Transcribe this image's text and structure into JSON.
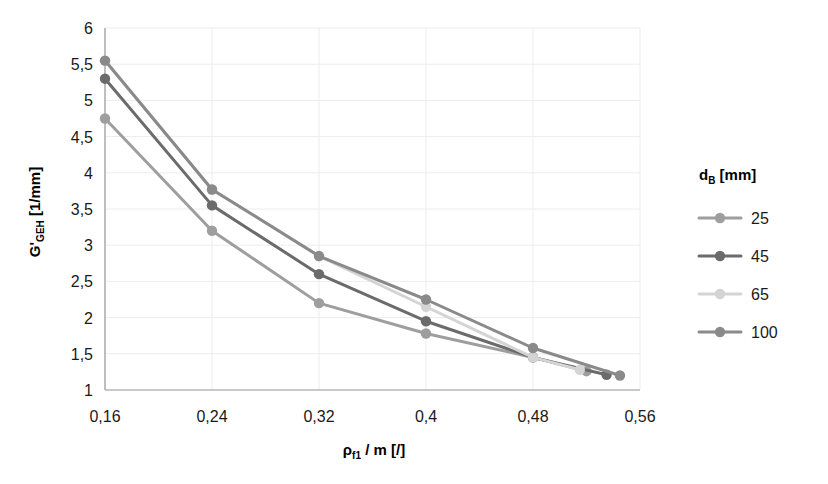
{
  "chart_data": {
    "type": "line",
    "title": "",
    "xlabel": "ρf1 / m [/]",
    "xlabel_base": "ρ",
    "xlabel_sub": "f1",
    "xlabel_rest": " / m [/]",
    "ylabel": "G'GEH [1/mm]",
    "ylabel_base": "G'",
    "ylabel_sub": "GEH",
    "ylabel_rest": " [1/mm]",
    "xlim": [
      0.16,
      0.56
    ],
    "ylim": [
      1,
      6
    ],
    "xticks": [
      0.16,
      0.24,
      0.32,
      0.4,
      0.48,
      0.56
    ],
    "xtick_labels": [
      "0,16",
      "0,24",
      "0,32",
      "0,4",
      "0,48",
      "0,56"
    ],
    "yticks": [
      1,
      1.5,
      2,
      2.5,
      3,
      3.5,
      4,
      4.5,
      5,
      5.5,
      6
    ],
    "ytick_labels": [
      "1",
      "1,5",
      "2",
      "2,5",
      "3",
      "3,5",
      "4",
      "4,5",
      "5",
      "5,5",
      "6"
    ],
    "grid": true,
    "legend_position": "right",
    "legend_title": "dB [mm]",
    "legend_title_base": "d",
    "legend_title_sub": "B",
    "legend_title_rest": " [mm]",
    "marker": "circle",
    "series": [
      {
        "name": "25",
        "color": "#9e9e9e",
        "x": [
          0.16,
          0.24,
          0.32,
          0.4,
          0.48,
          0.52
        ],
        "y": [
          4.75,
          3.2,
          2.2,
          1.78,
          1.45,
          1.26
        ]
      },
      {
        "name": "45",
        "color": "#6b6b6b",
        "x": [
          0.16,
          0.24,
          0.32,
          0.4,
          0.48,
          0.535
        ],
        "y": [
          5.3,
          3.55,
          2.6,
          1.95,
          1.45,
          1.21
        ]
      },
      {
        "name": "65",
        "color": "#d4d4d4",
        "x": [
          0.16,
          0.24,
          0.32,
          0.4,
          0.48,
          0.515
        ],
        "y": [
          5.55,
          3.77,
          2.85,
          2.15,
          1.45,
          1.28
        ]
      },
      {
        "name": "100",
        "color": "#8a8a8a",
        "x": [
          0.16,
          0.24,
          0.32,
          0.4,
          0.48,
          0.545
        ],
        "y": [
          5.55,
          3.77,
          2.85,
          2.25,
          1.58,
          1.2
        ]
      }
    ]
  }
}
